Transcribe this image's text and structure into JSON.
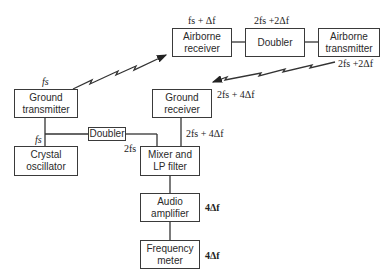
{
  "diagram": {
    "blocks": {
      "airborne_receiver": "Airborne receiver",
      "doubler_air": "Doubler",
      "airborne_transmitter": "Airborne transmitter",
      "ground_transmitter": "Ground transmitter",
      "ground_receiver": "Ground receiver",
      "doubler_ground": "Doubler",
      "crystal_oscillator": "Crystal oscillator",
      "mixer": "Mixer and LP filter",
      "audio_amplifier": "Audio amplifier",
      "frequency_meter": "Frequency meter"
    },
    "labels": {
      "gt_out": "fs",
      "ar_in": "fs + Δf",
      "doubler_out": "2fs +2Δf",
      "at_out": "2fs +2Δf",
      "gr_in": "2fs + 4Δf",
      "gr_out": "2fs + 4Δf",
      "osc_out": "fs",
      "doubler_ground_out": "2fs",
      "amp_out": "4Δf",
      "meter_val": "4Δf"
    }
  }
}
